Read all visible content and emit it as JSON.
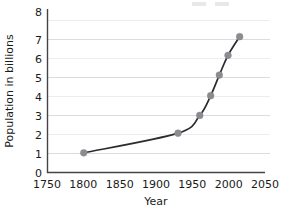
{
  "chart_data": {
    "type": "line",
    "title": "",
    "xlabel": "Year",
    "ylabel": "Population in billions",
    "xlim": [
      1750,
      2050
    ],
    "ylim": [
      0,
      8
    ],
    "xticks": [
      1750,
      1800,
      1850,
      1900,
      1950,
      2000,
      2050
    ],
    "yticks": [
      0,
      1,
      2,
      3,
      4,
      5,
      6,
      7,
      8
    ],
    "grid": "horizontal-even",
    "legend": "none",
    "marker_color": "#8c8c90",
    "line_color": "#2b2b30",
    "grid_color": "#d8d8dc",
    "axis_color": "#444448",
    "series": [
      {
        "name": "World population",
        "x": [
          1800,
          1930,
          1960,
          1975,
          1987,
          1999,
          2015
        ],
        "y": [
          1.0,
          2.0,
          2.9,
          3.9,
          4.95,
          5.95,
          6.9
        ]
      }
    ]
  },
  "axis": {
    "x_tick_labels": [
      "1750",
      "1800",
      "1850",
      "1900",
      "1950",
      "2000",
      "2050"
    ],
    "y_tick_labels": [
      "0",
      "1",
      "2",
      "3",
      "4",
      "5",
      "6",
      "7",
      "8"
    ],
    "x_axis_title": "Year",
    "y_axis_title": "Population in billions"
  }
}
